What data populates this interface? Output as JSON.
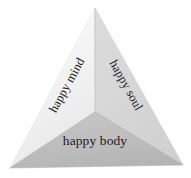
{
  "figure": {
    "name": "three-sided-pyramid",
    "background_color": "#ffffff",
    "text_color": "#1b1b1b",
    "faces": [
      {
        "id": "left",
        "label": "happy mind",
        "fill": "#f1f1f1",
        "rotation_degrees": -61,
        "points": "95,8 10,168 95,112"
      },
      {
        "id": "right",
        "label": "happy soul",
        "fill": "#d6d6d6",
        "rotation_degrees": 61,
        "points": "95,8 183,165 95,112"
      },
      {
        "id": "bottom",
        "label": "happy body",
        "fill": "#bdbdbd",
        "rotation_degrees": 0,
        "points": "10,168 183,165 95,112"
      }
    ],
    "vertices": {
      "apex": "95,8",
      "bottom_left": "10,168",
      "bottom_right": "183,165",
      "center": "95,112"
    }
  }
}
